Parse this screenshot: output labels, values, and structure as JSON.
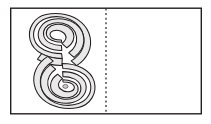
{
  "figure": {
    "type": "symmetry-completion-diagram",
    "title": "",
    "caption": "",
    "panel": {
      "shape": "rectangle",
      "x": 10,
      "y": 7.5,
      "width": 192,
      "height": 107,
      "fill_color": "#ffffff",
      "stroke_color": "#231f20",
      "stroke_width": 1.4
    },
    "mirror_line": {
      "name": "axis-of-symmetry",
      "orientation": "vertical",
      "x": 106,
      "y_top": 7.5,
      "y_bottom": 114.5,
      "stroke_color": "#231f20",
      "stroke_width": 1.2,
      "dash_pattern": "2 2.6"
    },
    "motif": {
      "name": "double-spiral",
      "description": "S-shaped double spiral ribbon",
      "half": "left",
      "turns_per_spiral": 3,
      "upper_spiral": {
        "center_x": 62,
        "center_y": 37,
        "winding": "clockwise-inward"
      },
      "lower_spiral": {
        "center_x": 62,
        "center_y": 82,
        "winding": "clockwise-inward"
      },
      "band_fill_color": "#e9e9e9",
      "band_stroke_color": "#231f20",
      "band_stroke_width": 1.05,
      "bounds": {
        "x": 29,
        "y": 14,
        "width": 66,
        "height": 94
      }
    },
    "right_half": {
      "name": "empty-answer-region",
      "content": "",
      "fill_color": "#ffffff"
    }
  },
  "colors": {
    "ink": "#231f20",
    "paper": "#ffffff",
    "band_fill": "#e9e9e9"
  }
}
